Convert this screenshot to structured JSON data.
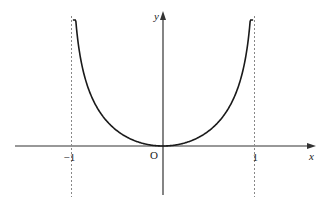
{
  "chart_data": {
    "type": "line",
    "title": "",
    "xlabel": "x",
    "ylabel": "y",
    "origin_label": "O",
    "x_ticks": [
      {
        "value": -1,
        "label": "−1"
      },
      {
        "value": 1,
        "label": "1"
      }
    ],
    "asymptotes": [
      -1,
      1
    ],
    "xlim": [
      -1.65,
      1.65
    ],
    "ylim": [
      -0.65,
      1.75
    ],
    "function_description": "even function, minimum 0 at x=0, increasing to infinity as x approaches ±1 (shape of y = -ln(1 - x^2))",
    "series": [
      {
        "name": "curve",
        "x_range": [
          -0.985,
          0.985
        ]
      }
    ]
  },
  "colors": {
    "axis": "#333333",
    "curve": "#1a1a1a",
    "asymptote": "#888888"
  }
}
